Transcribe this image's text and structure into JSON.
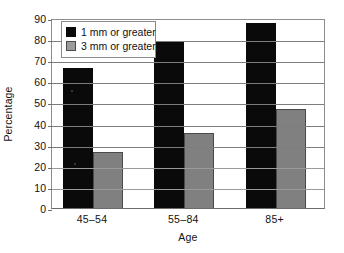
{
  "chart_data": {
    "type": "bar",
    "title": "",
    "xlabel": "Age",
    "ylabel": "Percentage",
    "categories": [
      "45–54",
      "55–84",
      "85+"
    ],
    "series": [
      {
        "name": "1 mm or greater",
        "color": "#0a0a0a",
        "values": [
          66.5,
          78.5,
          87.5
        ]
      },
      {
        "name": "3 mm or greater",
        "color": "#808080",
        "values": [
          26.5,
          35.5,
          47
        ]
      }
    ],
    "ylim": [
      0,
      90
    ],
    "ytick_step": 10,
    "yticks": [
      90,
      80,
      70,
      60,
      50,
      40,
      30,
      20,
      10,
      0
    ],
    "ytick_labels": [
      "90",
      "80",
      "70",
      "60",
      "50",
      "40",
      "30",
      "20",
      "10",
      "0"
    ],
    "grid": "horizontal",
    "legend_position": "top-left",
    "legend_entries": [
      "1 mm or greater",
      "3 mm or greater"
    ]
  },
  "axes": {
    "y_title": "Percentage",
    "x_title": "Age"
  }
}
